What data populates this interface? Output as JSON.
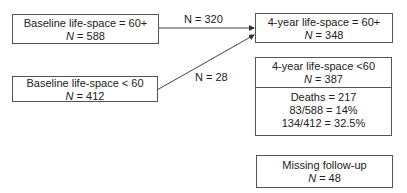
{
  "boxes": {
    "baseline_high": {
      "line1": "Baseline life-space = 60+",
      "n_label": "N",
      "n_value": " = 588"
    },
    "baseline_low": {
      "line1": "Baseline life-space < 60",
      "n_label": "N",
      "n_value": " = 412"
    },
    "followup_high": {
      "line1": "4-year life-space = 60+",
      "n_label": "N",
      "n_value": " = 348"
    },
    "followup_low": {
      "line1": "4-year life-space <60",
      "n_label": "N",
      "n_value": " = 387",
      "deaths": "Deaths = 217",
      "rate1": "83/588 = 14%",
      "rate2": "134/412 = 32.5%"
    },
    "missing": {
      "line1": "Missing follow-up",
      "n_label": "N",
      "n_value": " = 48"
    }
  },
  "arrows": {
    "high_to_high": "N = 320",
    "low_to_high": "N = 28"
  }
}
